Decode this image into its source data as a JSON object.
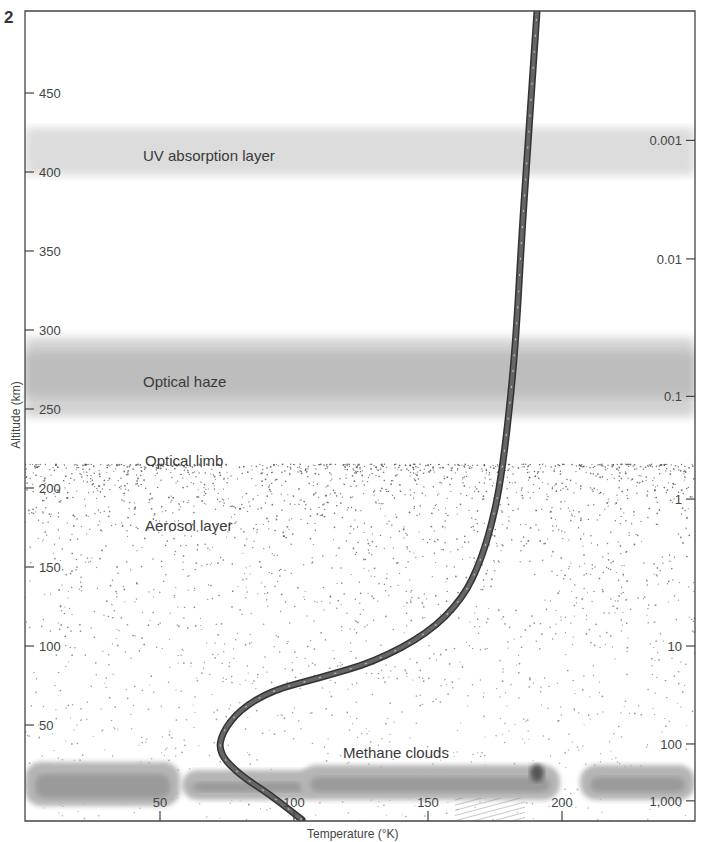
{
  "figure": {
    "number": "2"
  },
  "chart_data": {
    "type": "line",
    "title": "",
    "xlabel": "Temperature (°K)",
    "ylabel": "Altitude (km)",
    "y2label": "Pressure (mb)",
    "xlim": [
      0,
      250
    ],
    "ylim": [
      0,
      510
    ],
    "x_ticks": [
      50,
      100,
      150,
      200
    ],
    "y_ticks": [
      50,
      100,
      150,
      200,
      250,
      300,
      350,
      400,
      450
    ],
    "y2_ticks": [
      {
        "label": "0.001",
        "altitude": 420
      },
      {
        "label": "0.01",
        "altitude": 345
      },
      {
        "label": "0.1",
        "altitude": 258
      },
      {
        "label": "1",
        "altitude": 193
      },
      {
        "label": "10",
        "altitude": 100
      },
      {
        "label": "100",
        "altitude": 38
      },
      {
        "label": "1,000",
        "altitude": 2
      }
    ],
    "grid": false,
    "series": [
      {
        "name": "Temperature profile",
        "style": "dashed-thick",
        "points": [
          [
            103,
            -10
          ],
          [
            92,
            5
          ],
          [
            80,
            18
          ],
          [
            72,
            32
          ],
          [
            73,
            45
          ],
          [
            80,
            60
          ],
          [
            92,
            72
          ],
          [
            110,
            80
          ],
          [
            130,
            90
          ],
          [
            150,
            108
          ],
          [
            163,
            130
          ],
          [
            170,
            155
          ],
          [
            175,
            185
          ],
          [
            178,
            215
          ],
          [
            181,
            260
          ],
          [
            183,
            300
          ],
          [
            185,
            360
          ],
          [
            187,
            410
          ],
          [
            189,
            460
          ],
          [
            191,
            510
          ]
        ]
      }
    ],
    "layers": [
      {
        "name": "UV absorption layer",
        "alt_min": 398,
        "alt_max": 428,
        "type": "haze-light"
      },
      {
        "name": "Optical haze",
        "alt_min": 245,
        "alt_max": 295,
        "type": "haze-dark"
      },
      {
        "name": "Optical limb",
        "altitude": 225,
        "type": "label"
      },
      {
        "name": "Aerosol layer",
        "alt_min": 0,
        "alt_max": 215,
        "type": "stipple"
      },
      {
        "name": "Methane clouds",
        "alt_min": 10,
        "alt_max": 38,
        "type": "cloud"
      }
    ]
  },
  "labels": {
    "uv": "UV absorption layer",
    "haze": "Optical haze",
    "limb": "Optical limb",
    "aerosol": "Aerosol layer",
    "methane": "Methane clouds",
    "xaxis": "Temperature (°K)",
    "yaxis": "Altitude (km)",
    "y2axis": "Pressure (mb)"
  }
}
